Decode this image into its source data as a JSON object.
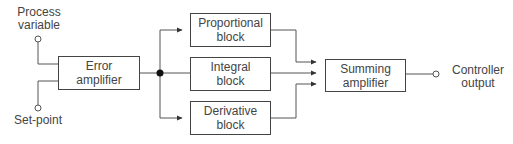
{
  "diagram": {
    "type": "block-diagram",
    "title": "",
    "inputs": {
      "process_variable": {
        "line1": "Process",
        "line2": "variable"
      },
      "set_point": {
        "label": "Set-point"
      }
    },
    "blocks": {
      "error_amplifier": {
        "line1": "Error",
        "line2": "amplifier"
      },
      "proportional": {
        "line1": "Proportional",
        "line2": "block"
      },
      "integral": {
        "line1": "Integral",
        "line2": "block"
      },
      "derivative": {
        "line1": "Derivative",
        "line2": "block"
      },
      "summing_amplifier": {
        "line1": "Summing",
        "line2": "amplifier"
      }
    },
    "outputs": {
      "controller_output": {
        "line1": "Controller",
        "line2": "output"
      }
    },
    "connections": [
      {
        "from": "Process variable",
        "to": "Error amplifier"
      },
      {
        "from": "Set-point",
        "to": "Error amplifier"
      },
      {
        "from": "Error amplifier",
        "to": "Proportional block"
      },
      {
        "from": "Error amplifier",
        "to": "Integral block"
      },
      {
        "from": "Error amplifier",
        "to": "Derivative block"
      },
      {
        "from": "Proportional block",
        "to": "Summing amplifier"
      },
      {
        "from": "Integral block",
        "to": "Summing amplifier"
      },
      {
        "from": "Derivative block",
        "to": "Summing amplifier"
      },
      {
        "from": "Summing amplifier",
        "to": "Controller output"
      }
    ]
  }
}
